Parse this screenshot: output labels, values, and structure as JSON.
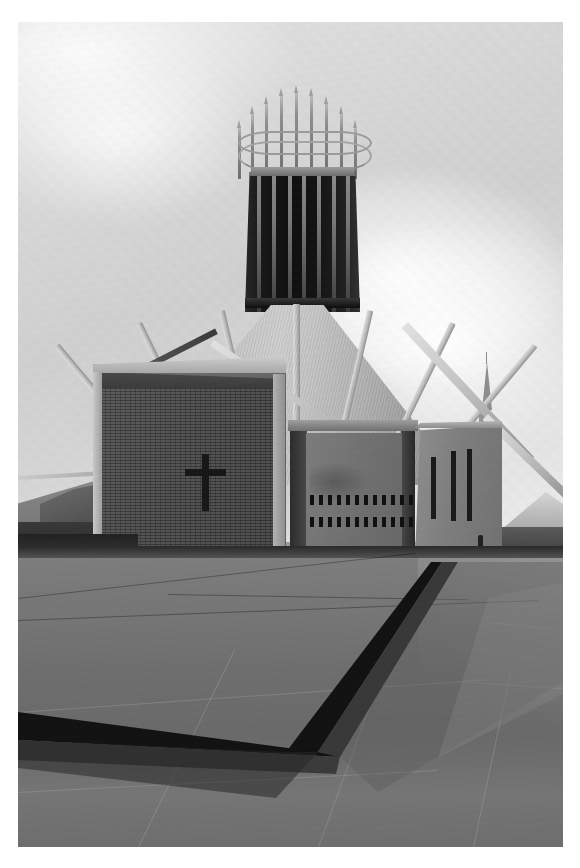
{
  "image": {
    "kind": "photograph",
    "subject": "Liverpool Metropolitan Cathedral",
    "palette": "black-and-white",
    "alt_text": "Black and white photograph of a modern circular cathedral with a conical roof, a dark glazed lantern tower crowned with thin spires, a brick chapel block bearing a plain cross, and a wide paved plaza in the foreground.",
    "frame": {
      "background_color": "#ffffff",
      "photo_left": 18,
      "photo_top": 22,
      "photo_width": 545,
      "photo_height": 825
    },
    "colors": {
      "sky_light": "#ededed",
      "sky_mid": "#d7d7d7",
      "cone_roof": "#bdbdbd",
      "tower_dark": "#161616",
      "brick_wall": "#454545",
      "concrete": "#7c7c7c",
      "plaza": "#6f6f6f",
      "shadow_black": "#131313"
    }
  },
  "scene": {
    "sky": {
      "label": "Overcast sky",
      "cloud_count": 3
    },
    "tower": {
      "label": "Lantern tower",
      "mullion_count": 7,
      "mullions_x": [
        12,
        27,
        43,
        57,
        72,
        87,
        101
      ]
    },
    "crown": {
      "label": "Crown of pinnacles",
      "pinnacle_count": 9,
      "pinnacles": [
        {
          "x": 6,
          "h": 52
        },
        {
          "x": 19,
          "h": 66
        },
        {
          "x": 33,
          "h": 76
        },
        {
          "x": 48,
          "h": 84
        },
        {
          "x": 63,
          "h": 87
        },
        {
          "x": 78,
          "h": 84
        },
        {
          "x": 93,
          "h": 76
        },
        {
          "x": 108,
          "h": 66
        },
        {
          "x": 122,
          "h": 52
        }
      ],
      "ring_count": 2
    },
    "cone": {
      "label": "Conical roof",
      "rib_count": 7,
      "ribs": [
        {
          "x": 48,
          "w": 6,
          "h": 182,
          "rot": -40
        },
        {
          "x": 92,
          "w": 6,
          "h": 180,
          "rot": -26
        },
        {
          "x": 136,
          "w": 6,
          "h": 179,
          "rot": -13
        },
        {
          "x": 170,
          "w": 7,
          "h": 181,
          "rot": 0
        },
        {
          "x": 204,
          "w": 6,
          "h": 179,
          "rot": 13
        },
        {
          "x": 248,
          "w": 6,
          "h": 180,
          "rot": 26
        },
        {
          "x": 292,
          "w": 6,
          "h": 182,
          "rot": 40
        }
      ]
    },
    "chapel": {
      "label": "Brick chapel block",
      "feature": "Latin cross relief",
      "cross_color": "#1a1a1a"
    },
    "panel": {
      "label": "Concrete panel with slot windows",
      "slot_rows": 2,
      "slots_per_row": 12
    },
    "right_block": {
      "label": "Concrete side block",
      "vertical_slots": [
        {
          "x": 16,
          "y": 32,
          "h": 62
        },
        {
          "x": 36,
          "y": 26,
          "h": 70
        },
        {
          "x": 52,
          "y": 24,
          "h": 72
        }
      ]
    },
    "struts": {
      "label": "Flying buttress struts",
      "items": [
        {
          "x": 196,
          "y": 318,
          "w": 250,
          "h": 7,
          "rot": 34,
          "tone": "light"
        },
        {
          "x": 390,
          "y": 300,
          "w": 185,
          "h": 9,
          "rot": 47,
          "tone": "light"
        },
        {
          "x": 470,
          "y": 392,
          "w": 120,
          "h": 8,
          "rot": 44,
          "tone": "light"
        },
        {
          "x": 108,
          "y": 352,
          "w": 100,
          "h": 6,
          "rot": -27,
          "tone": "dark"
        }
      ]
    },
    "distant_spire": {
      "label": "Distant church spire",
      "x": 452,
      "y": 340
    },
    "figure": {
      "label": "Pedestrian silhouette",
      "x": 460,
      "y": 513
    },
    "plaza": {
      "label": "Paved plaza",
      "joint_lines": [
        {
          "x": 0,
          "y": 576,
          "len": 400,
          "rot": -6.5,
          "tone": "dark"
        },
        {
          "x": 0,
          "y": 598,
          "len": 520,
          "rot": -2.2,
          "tone": "dark"
        },
        {
          "x": 150,
          "y": 572,
          "len": 300,
          "rot": 1.0,
          "tone": "dark"
        },
        {
          "x": 0,
          "y": 690,
          "len": 470,
          "rot": -4.0,
          "tone": "soft"
        },
        {
          "x": 0,
          "y": 770,
          "len": 420,
          "rot": -3.0,
          "tone": "soft"
        },
        {
          "x": 120,
          "y": 825,
          "len": 220,
          "rot": -64,
          "tone": "soft"
        },
        {
          "x": 300,
          "y": 825,
          "len": 200,
          "rot": -70,
          "tone": "soft"
        },
        {
          "x": 455,
          "y": 825,
          "len": 180,
          "rot": -78,
          "tone": "soft"
        },
        {
          "x": 470,
          "y": 600,
          "len": 110,
          "rot": 6,
          "tone": "soft"
        },
        {
          "x": 455,
          "y": 660,
          "len": 95,
          "rot": 4,
          "tone": "soft"
        }
      ],
      "dark_step_label": "Diagonal step shadow"
    }
  }
}
